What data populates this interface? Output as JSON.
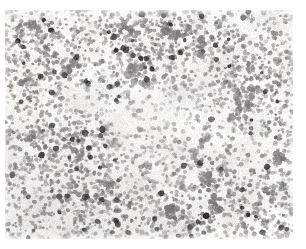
{
  "image": {
    "kind": "light-microscopy-micrograph",
    "subject": "dense monolayer of small round cells on pale stained background",
    "width_px": 306,
    "height_px": 249,
    "margins": {
      "left_px": 5,
      "top_px": 10,
      "right_px": 13,
      "bottom_px": 10,
      "margin_color": "#ffffff"
    },
    "field": {
      "x_px": 5,
      "y_px": 10,
      "width_px": 288,
      "height_px": 229
    },
    "palette": {
      "background": "#f4f3f0",
      "background_highlight": "#fbfaf8",
      "cell_light": "#bfbcbc",
      "cell_mid": "#9b9799",
      "cell_dark": "#6e696c",
      "nucleus_dark": "#3b3639",
      "nucleus_darkest": "#201d20",
      "margin": "#ffffff"
    },
    "texture": {
      "small_cell_count": 4200,
      "small_cell_radius_px": [
        1.1,
        2.6
      ],
      "dark_cell_count": 165,
      "dark_cell_radius_px": [
        1.8,
        3.6
      ],
      "clump_count": 46,
      "clump_radius_px": [
        7,
        22
      ],
      "grain_opacity": 0.1,
      "seed": 20240617
    },
    "density_hotspots": [
      {
        "x": 0.08,
        "y": 0.22,
        "r": 0.26,
        "w": 0.55
      },
      {
        "x": 0.21,
        "y": 0.62,
        "r": 0.24,
        "w": 0.5
      },
      {
        "x": 0.43,
        "y": 0.18,
        "r": 0.22,
        "w": 0.4
      },
      {
        "x": 0.63,
        "y": 0.12,
        "r": 0.25,
        "w": 0.52
      },
      {
        "x": 0.87,
        "y": 0.3,
        "r": 0.22,
        "w": 0.42
      },
      {
        "x": 0.3,
        "y": 0.92,
        "r": 0.24,
        "w": 0.48
      },
      {
        "x": 0.72,
        "y": 0.8,
        "r": 0.24,
        "w": 0.45
      },
      {
        "x": 0.95,
        "y": 0.92,
        "r": 0.2,
        "w": 0.38
      }
    ],
    "density_voids": [
      {
        "x": 0.5,
        "y": 0.46,
        "r": 0.17,
        "w": 0.55
      },
      {
        "x": 0.26,
        "y": 0.38,
        "r": 0.1,
        "w": 0.45
      },
      {
        "x": 0.68,
        "y": 0.55,
        "r": 0.12,
        "w": 0.4
      },
      {
        "x": 0.13,
        "y": 0.82,
        "r": 0.09,
        "w": 0.35
      },
      {
        "x": 0.86,
        "y": 0.62,
        "r": 0.1,
        "w": 0.35
      },
      {
        "x": 0.4,
        "y": 0.72,
        "r": 0.09,
        "w": 0.3
      }
    ]
  }
}
